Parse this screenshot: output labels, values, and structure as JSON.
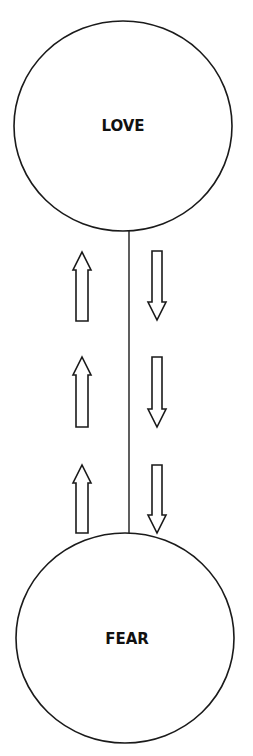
{
  "diagram": {
    "type": "two-node vertical flow",
    "nodes": [
      {
        "id": "love",
        "label": "LOVE",
        "position": "top"
      },
      {
        "id": "fear",
        "label": "FEAR",
        "position": "bottom"
      }
    ],
    "connector": {
      "from": "love",
      "to": "fear",
      "style": "solid line"
    },
    "arrows": {
      "left_column": {
        "direction": "up",
        "count": 3,
        "meaning": "movement toward LOVE"
      },
      "right_column": {
        "direction": "down",
        "count": 3,
        "meaning": "movement toward FEAR"
      }
    },
    "colors": {
      "stroke": "#1a1a1a",
      "fill": "#ffffff",
      "text": "#111111"
    }
  }
}
